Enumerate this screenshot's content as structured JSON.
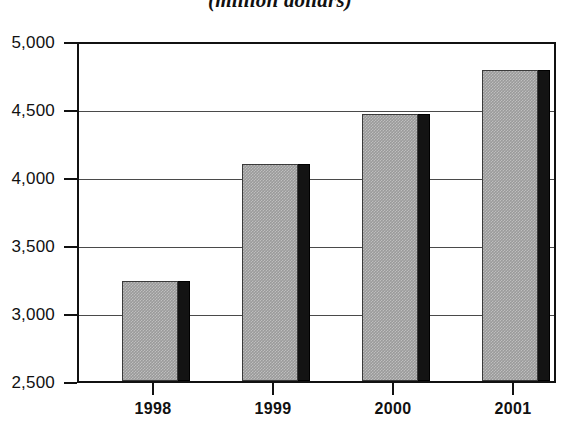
{
  "chart_data": {
    "type": "bar",
    "title": "(million dollars)",
    "xlabel": "",
    "ylabel": "",
    "categories": [
      "1998",
      "1999",
      "2000",
      "2001"
    ],
    "values": [
      3240,
      4110,
      4480,
      4810
    ],
    "ylim": [
      2500,
      5000
    ],
    "ytick_labels": [
      "5,000",
      "4,500",
      "4,000",
      "3,500",
      "3,000",
      "2,500"
    ],
    "ytick_values": [
      5000,
      4500,
      4000,
      3500,
      3000,
      2500
    ],
    "grid": true,
    "legend": "none",
    "series": [
      {
        "name": "",
        "values": [
          3240,
          4110,
          4480,
          4810
        ]
      }
    ],
    "style": {
      "bar_face_color": "#9a9a9a",
      "bar_side_color": "#131313",
      "axis_color": "#111111",
      "grid_color": "#4a4a4a",
      "background": "#ffffff"
    }
  }
}
